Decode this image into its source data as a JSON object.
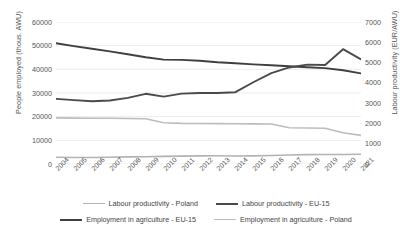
{
  "chart_data": {
    "type": "line",
    "title": "",
    "xlabel": "",
    "categories": [
      "2004",
      "2005",
      "2006",
      "2007",
      "2008",
      "2009",
      "2010",
      "2011",
      "2012",
      "2013",
      "2014",
      "2015",
      "2016",
      "2017",
      "2018",
      "2019",
      "2020",
      "2021"
    ],
    "axes": {
      "left": {
        "label": "People employed (thous. AWU)",
        "ticks": [
          0,
          10000,
          20000,
          30000,
          40000,
          50000,
          60000
        ],
        "min": 0,
        "max": 60000
      },
      "right": {
        "label": "Labour productivity (EUR/AWU)",
        "ticks": [
          0,
          1000,
          2000,
          3000,
          4000,
          5000,
          6000,
          7000
        ],
        "min": 0,
        "max": 7000
      }
    },
    "grid": true,
    "legend_position": "bottom",
    "series": [
      {
        "name": "Employment in agriculture - EU-15",
        "axis": "left",
        "unit": "thous. AWU",
        "color": "#3f3f3f",
        "width": 1.9,
        "values": [
          51000,
          49800,
          48700,
          47600,
          46400,
          45100,
          44100,
          44000,
          43600,
          43000,
          42600,
          42100,
          41700,
          41300,
          40900,
          40500,
          39600,
          38300
        ]
      },
      {
        "name": "Labour productivity - EU-15",
        "axis": "right",
        "unit": "EUR/AWU",
        "color": "#4a4a4a",
        "width": 1.9,
        "values": [
          3210,
          3150,
          3090,
          3130,
          3260,
          3460,
          3320,
          3470,
          3500,
          3500,
          3540,
          4030,
          4480,
          4760,
          4900,
          4880,
          5660,
          5160
        ]
      },
      {
        "name": "Employment in agriculture - Poland",
        "axis": "left",
        "unit": "thous. AWU",
        "color": "#bcbcbc",
        "width": 1.6,
        "values": [
          19500,
          19400,
          19350,
          19300,
          19250,
          19150,
          17400,
          17150,
          17100,
          17050,
          17000,
          16950,
          16900,
          15300,
          15200,
          15100,
          13200,
          12100
        ]
      },
      {
        "name": "Labour productivity - Poland",
        "axis": "right",
        "unit": "EUR/AWU",
        "color": "#b3b3b3",
        "width": 1.6,
        "values": [
          330,
          320,
          320,
          335,
          350,
          360,
          375,
          390,
          400,
          405,
          395,
          400,
          420,
          445,
          460,
          465,
          470,
          480
        ]
      }
    ]
  },
  "legend": {
    "rows": [
      [
        {
          "label": "Labour productivity - Poland",
          "color": "#b3b3b3",
          "width": 1.6
        },
        {
          "label": "Labour productivity - EU-15",
          "color": "#4a4a4a",
          "width": 2.2
        }
      ],
      [
        {
          "label": "Employment in agriculture - EU-15",
          "color": "#3f3f3f",
          "width": 2.2
        },
        {
          "label": "Employment in agriculture - Poland",
          "color": "#bcbcbc",
          "width": 1.6
        }
      ]
    ]
  }
}
